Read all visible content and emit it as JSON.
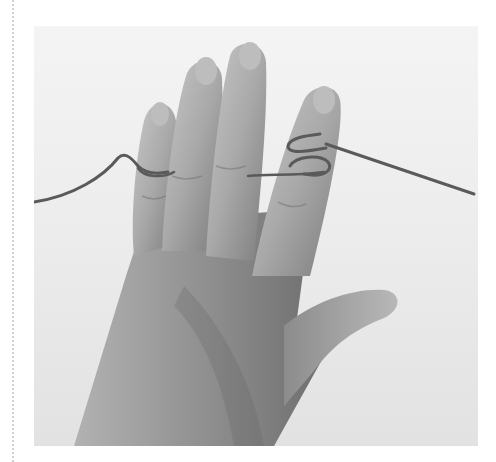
{
  "image": {
    "caption": "Hand with yarn wrapped around the index and little fingers",
    "style": "grayscale photograph",
    "colors": {
      "background_light": "#f2f2f2",
      "background_mid": "#e4e4e4",
      "skin_light": "#c4c4c4",
      "skin_mid": "#a8a8a8",
      "skin_dark": "#7a7a7a",
      "yarn": "#5a5a5a",
      "dotted_rule": "#d2d2d2"
    }
  }
}
